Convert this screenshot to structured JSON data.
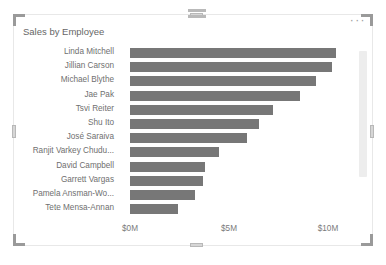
{
  "visual": {
    "title": "Sales by Employee",
    "more_menu_label": "···",
    "drag_grip_name": "drag-grip-icon",
    "scrollbar_present": true
  },
  "colors": {
    "bar_fill": "#777777",
    "title_text": "#666666",
    "axis_text": "#7a7a7a",
    "category_text": "#6f6f6f",
    "visual_border": "#e8e8e8",
    "handle_fill": "#d6d6d6",
    "scroll_thumb": "#ededed"
  },
  "chart_data": {
    "type": "bar",
    "orientation": "horizontal",
    "title": "Sales by Employee",
    "xlabel": "",
    "ylabel": "",
    "grid": false,
    "legend": "none",
    "xlim": [
      0,
      12
    ],
    "x_tick_labels": [
      "$0M",
      "$5M",
      "$10M"
    ],
    "x_tick_values": [
      0,
      5,
      10
    ],
    "categories": [
      "Linda Mitchell",
      "Jillian Carson",
      "Michael Blythe",
      "Jae Pak",
      "Tsvi Reiter",
      "Shu Ito",
      "José Saraiva",
      "Ranjit Varkey Chudu...",
      "David Campbell",
      "Garrett Vargas",
      "Pamela Ansman-Wo...",
      "Tete Mensa-Annan"
    ],
    "values": [
      10.4,
      10.2,
      9.4,
      8.6,
      7.2,
      6.5,
      5.9,
      4.5,
      3.8,
      3.7,
      3.3,
      2.4
    ],
    "value_unit": "M"
  }
}
